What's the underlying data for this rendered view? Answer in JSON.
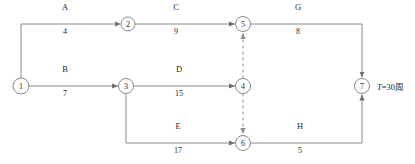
{
  "diagram": {
    "type": "network-precedence-diagram",
    "nodes": [
      {
        "id": "1",
        "label": "1",
        "cx": 21,
        "cy": 86,
        "r": 8
      },
      {
        "id": "2",
        "label": "2",
        "cx": 128,
        "cy": 24,
        "r": 7
      },
      {
        "id": "3",
        "label": "3",
        "cx": 126,
        "cy": 86,
        "r": 7.5
      },
      {
        "id": "4",
        "label": "4",
        "cx": 243,
        "cy": 86,
        "r": 7.5
      },
      {
        "id": "5",
        "label": "5",
        "cx": 243,
        "cy": 24,
        "r": 7.5
      },
      {
        "id": "6",
        "label": "6",
        "cx": 243,
        "cy": 143,
        "r": 7.5
      },
      {
        "id": "7",
        "label": "7",
        "cx": 362,
        "cy": 86,
        "r": 7.5
      }
    ],
    "activities": [
      {
        "key": "A",
        "name": "A",
        "duration": "4",
        "from": "1",
        "to": "2",
        "name_x": 65,
        "name_y": 9,
        "dur_x": 65,
        "dur_y": 29
      },
      {
        "key": "C",
        "name": "C",
        "duration": "9",
        "from": "2",
        "to": "5",
        "name_x": 176,
        "name_y": 9,
        "dur_x": 176,
        "dur_y": 29
      },
      {
        "key": "G",
        "name": "G",
        "duration": "8",
        "from": "5",
        "to": "7",
        "name_x": 298,
        "name_y": 9,
        "dur_x": 298,
        "dur_y": 29
      },
      {
        "key": "B",
        "name": "B",
        "duration": "7",
        "from": "1",
        "to": "3",
        "name_x": 65,
        "name_y": 71,
        "dur_x": 65,
        "dur_y": 91
      },
      {
        "key": "D",
        "name": "D",
        "duration": "15",
        "from": "3",
        "to": "4",
        "name_x": 179,
        "name_y": 71,
        "dur_x": 179,
        "dur_y": 91
      },
      {
        "key": "E",
        "name": "E",
        "duration": "17",
        "from": "3",
        "to": "6",
        "name_x": 178,
        "name_y": 127,
        "dur_x": 178,
        "dur_y": 148
      },
      {
        "key": "H",
        "name": "H",
        "duration": "5",
        "from": "6",
        "to": "7",
        "name_x": 300,
        "name_y": 127,
        "dur_x": 300,
        "dur_y": 148
      }
    ],
    "dummy_links": [
      {
        "from": "4",
        "to": "5",
        "style": "dashed-arrow-up"
      },
      {
        "from": "4",
        "to": "6",
        "style": "dashed-arrow-down"
      }
    ],
    "total_duration": {
      "symbol": "T",
      "equals": "=",
      "value": "30",
      "unit": "周",
      "full_text": "T=30周",
      "x": 377,
      "y": 80
    },
    "colors": {
      "line": "#8a8a8a",
      "dummy_line": "#9e9e9e",
      "text": "#1f1f1f",
      "node_fill": "#ffffff",
      "background": "#ffffff"
    }
  }
}
